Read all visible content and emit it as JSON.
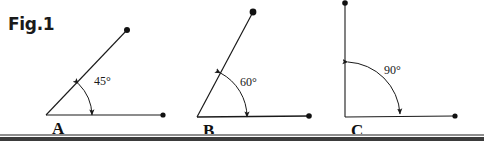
{
  "figure": {
    "title": "Fig.1",
    "background_color": "#ffffff",
    "stroke_color": "#1a1a1a",
    "width": 484,
    "height": 142
  },
  "diagrams": [
    {
      "id": "diagram-a",
      "vertex_label": "A",
      "angle_label": "45°",
      "angle_degrees": 45,
      "vertex": {
        "x": 46,
        "y": 115
      },
      "horizontal_ray_end": {
        "x": 163,
        "y": 115
      },
      "inclined_ray_end": {
        "x": 127,
        "y": 30
      },
      "arc_radius": 46,
      "label_position": {
        "x": 94,
        "y": 75
      },
      "vertex_label_position": {
        "x": 52,
        "y": 120
      }
    },
    {
      "id": "diagram-b",
      "vertex_label": "B",
      "angle_label": "60°",
      "angle_degrees": 60,
      "vertex": {
        "x": 197,
        "y": 117
      },
      "horizontal_ray_end": {
        "x": 309,
        "y": 116
      },
      "inclined_ray_end": {
        "x": 253,
        "y": 12
      },
      "arc_radius": 50,
      "label_position": {
        "x": 240,
        "y": 76
      },
      "vertex_label_position": {
        "x": 203,
        "y": 122
      }
    },
    {
      "id": "diagram-c",
      "vertex_label": "C",
      "angle_label": "90°",
      "angle_degrees": 90,
      "vertex": {
        "x": 345,
        "y": 117
      },
      "horizontal_ray_end": {
        "x": 455,
        "y": 116
      },
      "inclined_ray_end": {
        "x": 345,
        "y": 3
      },
      "arc_radius": 55,
      "label_position": {
        "x": 384,
        "y": 64
      },
      "vertex_label_position": {
        "x": 351,
        "y": 122
      }
    }
  ],
  "bottom_rules": {
    "light_color": "#8e8e8e",
    "light_y": 134,
    "dark_color": "#3b3b3b",
    "dark_y": 137
  }
}
